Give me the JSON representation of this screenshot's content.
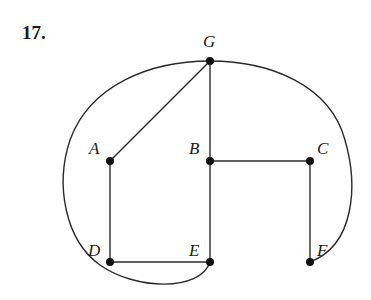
{
  "problem": {
    "number": "17."
  },
  "graph": {
    "vertices": [
      {
        "id": "G",
        "label": "G",
        "x": 210,
        "y": 61,
        "lx": 210,
        "ly": 47
      },
      {
        "id": "A",
        "label": "A",
        "x": 110,
        "y": 161,
        "lx": 96,
        "ly": 149
      },
      {
        "id": "B",
        "label": "B",
        "x": 210,
        "y": 161,
        "lx": 196,
        "ly": 149
      },
      {
        "id": "C",
        "label": "C",
        "x": 310,
        "y": 161,
        "lx": 323,
        "ly": 149
      },
      {
        "id": "D",
        "label": "D",
        "x": 110,
        "y": 262,
        "lx": 96,
        "ly": 251
      },
      {
        "id": "E",
        "label": "E",
        "x": 210,
        "y": 262,
        "lx": 196,
        "ly": 251
      },
      {
        "id": "F",
        "label": "F",
        "x": 310,
        "y": 262,
        "lx": 323,
        "ly": 251
      }
    ],
    "edges": [
      {
        "from": "G",
        "to": "A",
        "type": "straight"
      },
      {
        "from": "G",
        "to": "B",
        "type": "straight"
      },
      {
        "from": "B",
        "to": "E",
        "type": "straight"
      },
      {
        "from": "B",
        "to": "C",
        "type": "straight"
      },
      {
        "from": "C",
        "to": "F",
        "type": "straight"
      },
      {
        "from": "A",
        "to": "D",
        "type": "straight"
      },
      {
        "from": "D",
        "to": "E",
        "type": "straight"
      },
      {
        "from": "G",
        "to": "E",
        "type": "curve-left"
      },
      {
        "from": "G",
        "to": "F",
        "type": "curve-right"
      }
    ]
  }
}
